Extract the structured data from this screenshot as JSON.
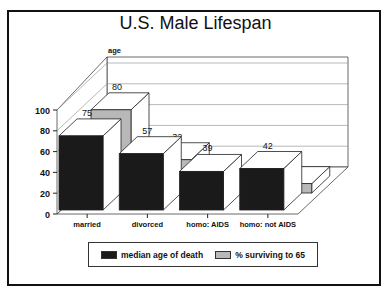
{
  "chart_data": {
    "type": "bar",
    "style": "3d-clustered",
    "title": "U.S. Male Lifespan",
    "ylabel": "age",
    "xlabel": "",
    "ylim": [
      0,
      100
    ],
    "yticks": [
      0,
      20,
      40,
      60,
      80,
      100
    ],
    "grid": true,
    "legend_position": "bottom",
    "categories": [
      "married",
      "divorced",
      "homo: AIDS",
      "homo: not AIDS"
    ],
    "series": [
      {
        "name": "median age of death",
        "color": "#1a1a1a",
        "values": [
          75,
          57,
          39,
          42
        ]
      },
      {
        "name": "% surviving to 65",
        "color": "#b8b8b8",
        "values": [
          80,
          32,
          1,
          9
        ]
      }
    ]
  },
  "title": "U.S. Male Lifespan",
  "axis": {
    "ylabel": "age",
    "ticks": [
      "0",
      "20",
      "40",
      "60",
      "80",
      "100"
    ]
  },
  "categories": [
    "married",
    "divorced",
    "homo: AIDS",
    "homo: not AIDS"
  ],
  "legend": {
    "items": [
      {
        "label": "median age of death",
        "color": "#1a1a1a"
      },
      {
        "label": "% surviving to 65",
        "color": "#b8b8b8"
      }
    ]
  }
}
